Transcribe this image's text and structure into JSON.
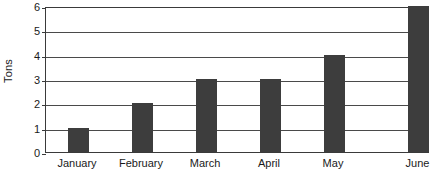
{
  "chart_data": {
    "type": "bar",
    "title": "",
    "xlabel": "",
    "ylabel": "Tons",
    "categories": [
      "January",
      "February",
      "March",
      "April",
      "May",
      "June"
    ],
    "values": [
      1,
      2,
      3,
      3,
      4,
      6
    ],
    "ylim": [
      0,
      6
    ],
    "ytick_labels": [
      "0",
      "1",
      "2",
      "3",
      "4",
      "5",
      "6"
    ],
    "ytick_values": [
      0,
      1,
      2,
      3,
      4,
      5,
      6
    ],
    "grid": true,
    "legend": false,
    "legend_position": "none",
    "series": [
      {
        "name": "Tons",
        "values": [
          1,
          2,
          3,
          3,
          4,
          6
        ],
        "color": "#3d3d3d"
      }
    ],
    "colors": {
      "bar": "#3d3d3d",
      "axis": "#3a3a3a",
      "gridline": "#4a4a4a",
      "text": "#1a1a1a",
      "background": "#ffffff"
    }
  }
}
